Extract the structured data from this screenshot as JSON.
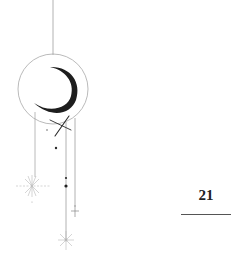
{
  "page": {
    "number": "21"
  },
  "ornament": {
    "description": "celestial moon and star hanging ornament",
    "colors": {
      "line": "#9a9a9a",
      "moon": "#1e1e1e",
      "dot": "#2a2a2a",
      "sparkle": "#b0b0b0"
    }
  }
}
